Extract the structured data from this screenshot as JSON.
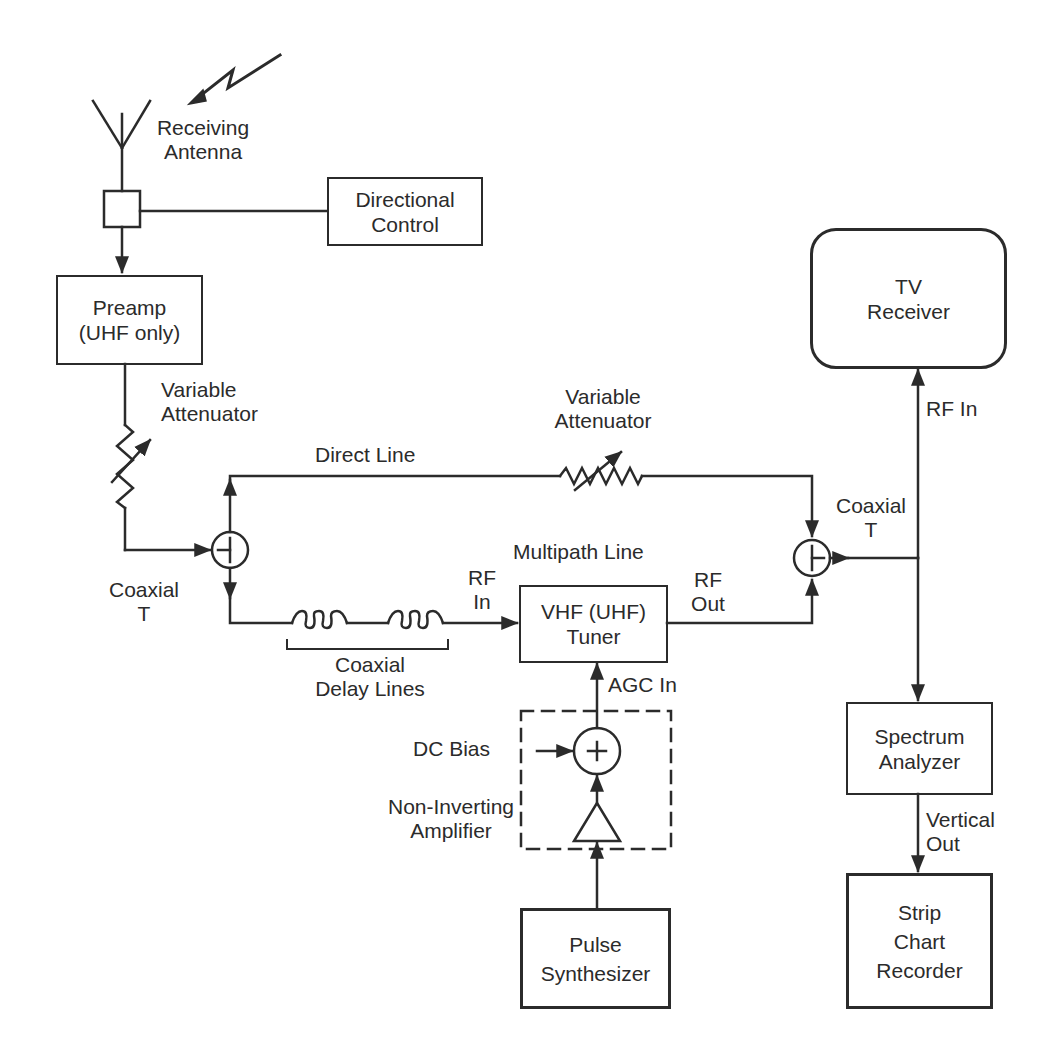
{
  "figure": {
    "type": "block-diagram",
    "top_cropped_caption_fragment": ""
  },
  "blocks": {
    "directional_control": {
      "lines": [
        "Directional",
        "Control"
      ]
    },
    "preamp": {
      "lines": [
        "Preamp",
        "(UHF only)"
      ]
    },
    "tv_receiver": {
      "lines": [
        "TV",
        "Receiver"
      ]
    },
    "tuner": {
      "lines": [
        "VHF (UHF)",
        "Tuner"
      ]
    },
    "spectrum_analyzer": {
      "lines": [
        "Spectrum",
        "Analyzer"
      ]
    },
    "strip_chart_recorder": {
      "lines": [
        "Strip",
        "Chart",
        "Recorder"
      ]
    },
    "pulse_synthesizer": {
      "lines": [
        "Pulse",
        "Synthesizer"
      ]
    }
  },
  "labels": {
    "receiving_antenna": [
      "Receiving",
      "Antenna"
    ],
    "variable_attenuator_left": [
      "Variable",
      "Attenuator"
    ],
    "variable_attenuator_right": [
      "Variable",
      "Attenuator"
    ],
    "direct_line": "Direct Line",
    "multipath_line": "Multipath Line",
    "coaxial_t_left": [
      "Coaxial",
      "T"
    ],
    "coaxial_t_right": [
      "Coaxial",
      "T"
    ],
    "rf_in_tuner": [
      "RF",
      "In"
    ],
    "rf_out_tuner": [
      "RF",
      "Out"
    ],
    "rf_in_tv": "RF In",
    "coaxial_delay_lines": [
      "Coaxial",
      "Delay Lines"
    ],
    "agc_in": "AGC In",
    "dc_bias": "DC Bias",
    "non_inverting_amplifier": [
      "Non-Inverting",
      "Amplifier"
    ],
    "vertical_out": [
      "Vertical",
      "Out"
    ],
    "summer_symbol": "+"
  },
  "colors": {
    "ink": "#2b2b2b",
    "paper": "#ffffff"
  }
}
